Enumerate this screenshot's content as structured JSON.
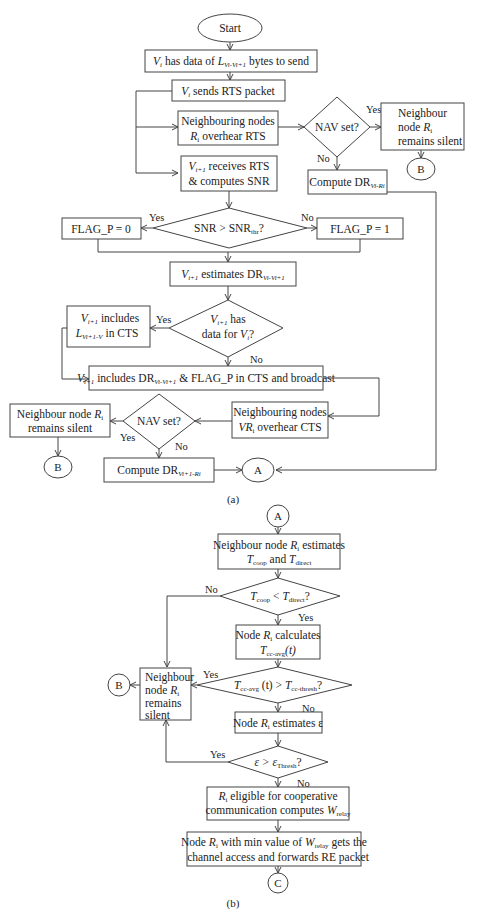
{
  "figure": {
    "part_a": {
      "caption": "(a)",
      "start": "Start",
      "vi_has_data": "Vi has data of L(Vi-Vi+1) bytes to send",
      "vi_has_data_parts": [
        "V",
        "i",
        " has data of ",
        "L",
        "Vi-Vi+1",
        " bytes to send"
      ],
      "vi_sends_rts": [
        "V",
        "i",
        " sends RTS packet"
      ],
      "neighbours_overhear_rts": [
        "Neighbouring nodes",
        "R",
        "i",
        " overhear RTS"
      ],
      "nav_set_1": "NAV set?",
      "nav_yes_1": "Yes",
      "nav_no_1": "No",
      "silent_1": [
        "Neighbour",
        "node ",
        "R",
        "i",
        "remains silent"
      ],
      "connector_b_1": "B",
      "compute_dr_vi_ri": [
        "Compute DR",
        "Vi-Ri"
      ],
      "vi1_receives_rts": [
        "V",
        "i+1",
        " receives RTS",
        "& computes SNR"
      ],
      "snr_decision": [
        "SNR > SNR",
        "thr",
        "?"
      ],
      "snr_yes": "Yes",
      "snr_no": "No",
      "flag_p0": "FLAG_P = 0",
      "flag_p1": "FLAG_P = 1",
      "vi1_estimates": [
        "V",
        "i+1",
        " estimates DR",
        "Vi-Vi+1"
      ],
      "has_data_decision": [
        "V",
        "i+1",
        " has",
        "data for ",
        "V",
        "i",
        "?"
      ],
      "has_data_yes": "Yes",
      "has_data_no": "No",
      "includes_l": [
        "V",
        "i+1",
        " includes",
        "L",
        "Vi+1-V",
        " in CTS"
      ],
      "includes_dr": [
        "V",
        "i+1",
        " includes DR",
        "Vi-Vi+1",
        " & FLAG_P in CTS and broadcast"
      ],
      "neighbours_overhear_cts": [
        "Neighbouring nodes",
        "VR",
        "i",
        " overhear CTS"
      ],
      "nav_set_2": "NAV set?",
      "nav_yes_2": "Yes",
      "nav_no_2": "No",
      "silent_2": [
        "Neighbour node ",
        "R",
        "i",
        "remains silent"
      ],
      "connector_b_2": "B",
      "compute_dr_vi1_ri": [
        "Compute DR",
        "Vi+1-Ri"
      ],
      "connector_a": "A"
    },
    "part_b": {
      "caption": "(b)",
      "connector_a": "A",
      "estimates_t": [
        "Neighbour node ",
        "R",
        "i",
        " estimates",
        "T",
        "coop",
        " and ",
        "T",
        "direct"
      ],
      "tcoop_decision": [
        "T",
        "coop",
        " < ",
        "T",
        "direct",
        "?"
      ],
      "tcoop_no": "No",
      "tcoop_yes": "Yes",
      "calculates_tcc": [
        "Node ",
        "R",
        "i",
        " calculates",
        "T",
        "cc-avg",
        "(t)"
      ],
      "tcc_decision": [
        "T",
        "cc-avg",
        " (t) > ",
        "T",
        "cc-thresh",
        "?"
      ],
      "tcc_yes": "Yes",
      "tcc_no": "No",
      "silent": [
        "Neighbour",
        "node ",
        "R",
        "i",
        "remains",
        "silent"
      ],
      "connector_b": "B",
      "estimates_eps": [
        "Node ",
        "R",
        "i",
        " estimates ε"
      ],
      "eps_decision": [
        "ε > ε",
        "Thresh",
        "?"
      ],
      "eps_yes": "Yes",
      "eps_no": "No",
      "eligible": [
        "R",
        "i",
        " eligible for cooperative",
        "communication computes ",
        "W",
        "relay"
      ],
      "min_w": [
        "Node ",
        "R",
        "i",
        " with min value of ",
        "W",
        "relay",
        " gets the",
        "channel access and forwards RE packet"
      ],
      "connector_c": "C"
    }
  }
}
